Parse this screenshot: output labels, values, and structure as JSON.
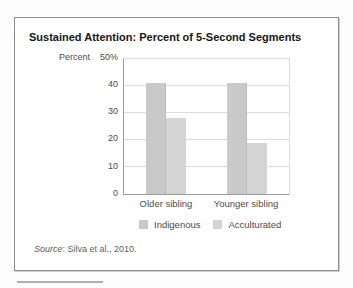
{
  "figure": {
    "title": "Sustained Attention: Percent of 5-Second Segments",
    "source": {
      "label": "Source",
      "rest": ": Silva et al., 2010."
    }
  },
  "chart_data": {
    "type": "bar",
    "title": "Sustained Attention: Percent of 5-Second Segments",
    "categories": [
      "Older sibling",
      "Younger sibling"
    ],
    "series": [
      {
        "name": "Indigenous",
        "color": "#c9c9ca",
        "values": [
          41,
          41
        ]
      },
      {
        "name": "Acculturated",
        "color": "#d4d4d5",
        "values": [
          28,
          19
        ]
      }
    ],
    "ylabel": "Percent",
    "yticks": [
      "50%",
      "40",
      "30",
      "20",
      "10",
      "0"
    ],
    "ytick_values": [
      50,
      40,
      30,
      20,
      10,
      0
    ],
    "ylim": [
      0,
      50
    ],
    "grid": true,
    "legend_position": "bottom"
  },
  "colors": {
    "frame_border": "#8d8d8d",
    "axis_line": "#9c9c9c",
    "gridline": "#dcdcdc",
    "bottom_rule": "#b0b0b0"
  }
}
